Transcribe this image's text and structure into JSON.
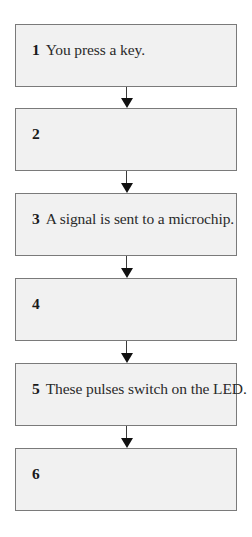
{
  "diagram": {
    "type": "vertical-flowchart",
    "steps": [
      {
        "number": "1",
        "text": "You press a key."
      },
      {
        "number": "2",
        "text": ""
      },
      {
        "number": "3",
        "text": "A signal is sent to a microchip."
      },
      {
        "number": "4",
        "text": ""
      },
      {
        "number": "5",
        "text": "These pulses switch on the LED."
      },
      {
        "number": "6",
        "text": ""
      }
    ],
    "arrows": [
      {
        "from": "1",
        "to": "2",
        "icon": "arrow-down-icon"
      },
      {
        "from": "2",
        "to": "3",
        "icon": "arrow-down-icon"
      },
      {
        "from": "3",
        "to": "4",
        "icon": "arrow-down-icon"
      },
      {
        "from": "4",
        "to": "5",
        "icon": "arrow-down-icon"
      },
      {
        "from": "5",
        "to": "6",
        "icon": "arrow-down-icon"
      }
    ],
    "colors": {
      "box_fill": "#f1f1f1",
      "box_border": "#7a7a7a",
      "arrow": "#111111",
      "text": "#2a2a2a"
    }
  }
}
